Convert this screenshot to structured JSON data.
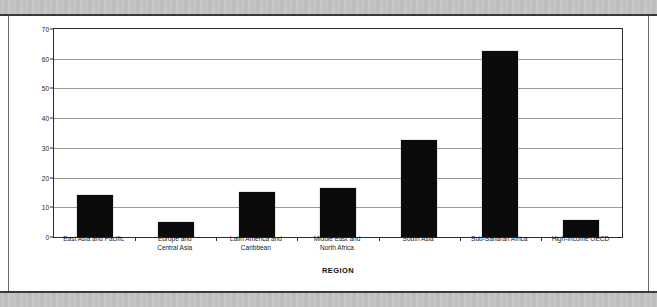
{
  "chart_data": {
    "type": "bar",
    "title": "",
    "xlabel": "REGION",
    "ylabel": "Percent",
    "ylim": [
      0,
      70
    ],
    "yticks": [
      0,
      10,
      20,
      30,
      40,
      50,
      60,
      70
    ],
    "grid": true,
    "legend": "none",
    "bar_color": "#0b0b0b",
    "categories": [
      "East Asia and Pacific",
      "Europe and\nCentral Asia",
      "Latin America and\nCaribbean",
      "Middle East and\nNorth Africa",
      "South Asia",
      "Sub-Saharan Africa",
      "High-Income OECD"
    ],
    "values": [
      14,
      5,
      15,
      16.5,
      32.5,
      62.5,
      5.7
    ]
  },
  "figure": {
    "y_axis_title": "Percent",
    "x_axis_title": "REGION"
  }
}
